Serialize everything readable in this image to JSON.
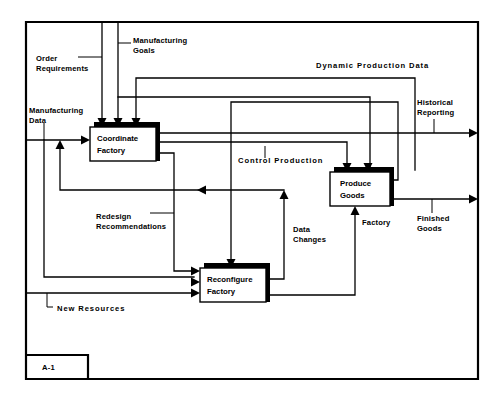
{
  "diagram": {
    "node_id": "A-1",
    "frame": {
      "x": 26,
      "y": 22,
      "width": 452,
      "height": 357
    },
    "colors": {
      "line": "#000000",
      "fill": "#ffffff",
      "shadow": "#000000"
    },
    "boxes": [
      {
        "id": "coordinate-factory",
        "label_line1": "Coordinate",
        "label_line2": "Factory",
        "x": 90,
        "y": 127,
        "width": 66,
        "height": 34
      },
      {
        "id": "produce-goods",
        "label_line1": "Produce",
        "label_line2": "Goods",
        "x": 330,
        "y": 172,
        "width": 60,
        "height": 34
      },
      {
        "id": "reconfigure-factory",
        "label_line1": "Reconfigure",
        "label_line2": "Factory",
        "x": 200,
        "y": 268,
        "width": 66,
        "height": 34
      }
    ],
    "labels": [
      {
        "id": "order-requirements",
        "line1": "Order",
        "line2": "Requirements",
        "x": 36,
        "y": 58,
        "spaced": false
      },
      {
        "id": "manufacturing-goals",
        "line1": "Manufacturing",
        "line2": "Goals",
        "x": 133,
        "y": 40,
        "spaced": false
      },
      {
        "id": "dynamic-production-data",
        "line1": "Dynamic  Production  Data",
        "line2": "",
        "x": 316,
        "y": 65,
        "spaced": true
      },
      {
        "id": "manufacturing-data",
        "line1": "Manufacturing",
        "line2": "Data",
        "x": 29,
        "y": 110,
        "spaced": false
      },
      {
        "id": "historical-reporting",
        "line1": "Historical",
        "line2": "Reporting",
        "x": 417,
        "y": 108,
        "spaced": false
      },
      {
        "id": "control-production",
        "line1": "Control  Production",
        "line2": "",
        "x": 238,
        "y": 160,
        "spaced": true
      },
      {
        "id": "redesign-recommendations",
        "line1": "Redesign",
        "line2": "Recommendations",
        "x": 96,
        "y": 216,
        "spaced": false
      },
      {
        "id": "data-changes",
        "line1": "Data",
        "line2": "Changes",
        "x": 293,
        "y": 229,
        "spaced": false
      },
      {
        "id": "factory",
        "line1": "Factory",
        "line2": "",
        "x": 362,
        "y": 222,
        "spaced": false
      },
      {
        "id": "finished-goods",
        "line1": "Finished",
        "line2": "Goods",
        "x": 417,
        "y": 218,
        "spaced": false
      },
      {
        "id": "new-resources",
        "line1": "New  Resources",
        "line2": "",
        "x": 55,
        "y": 310,
        "spaced": true
      }
    ]
  }
}
